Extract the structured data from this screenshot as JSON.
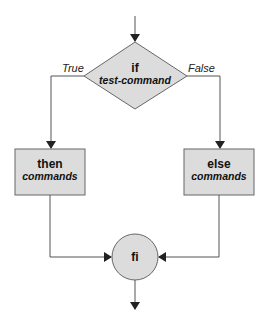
{
  "diagram": {
    "type": "flowchart",
    "colors": {
      "node_fill": "#dcdcdc",
      "node_stroke": "#666666",
      "line": "#555555",
      "text": "#111111",
      "background": "#ffffff"
    },
    "nodes": {
      "decision": {
        "keyword": "if",
        "label": "test-command"
      },
      "then_box": {
        "keyword": "then",
        "label": "commands"
      },
      "else_box": {
        "keyword": "else",
        "label": "commands"
      },
      "end": {
        "keyword": "fi"
      }
    },
    "edges": {
      "true_label": "True",
      "false_label": "False"
    }
  }
}
